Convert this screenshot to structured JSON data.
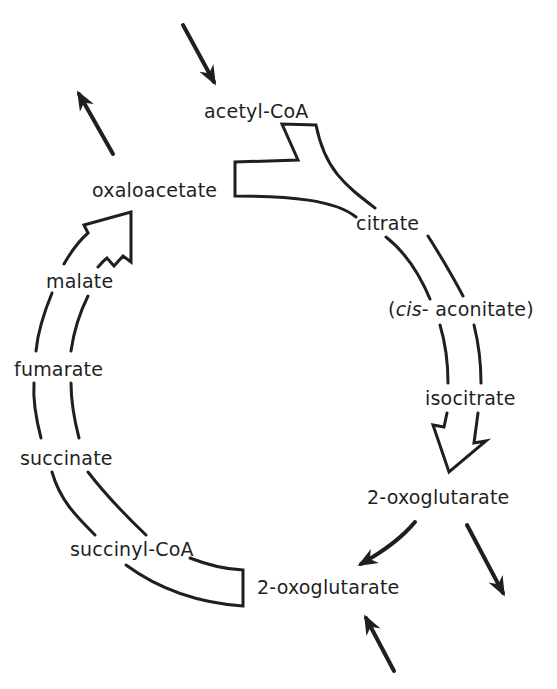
{
  "diagram": {
    "colors": {
      "ink": "#1f1f1f",
      "background": "#ffffff"
    },
    "metabolites": [
      {
        "id": "acetyl-coa",
        "label": "acetyl-CoA"
      },
      {
        "id": "oxaloacetate",
        "label": "oxaloacetate"
      },
      {
        "id": "citrate",
        "label": "citrate"
      },
      {
        "id": "cis-aconitate",
        "label_prefix": "(",
        "label_italic": "cis",
        "label_suffix": "- aconitate)"
      },
      {
        "id": "isocitrate",
        "label": "isocitrate"
      },
      {
        "id": "2-oxoglutarate-a",
        "label": "2-oxoglutarate"
      },
      {
        "id": "2-oxoglutarate-b",
        "label": "2-oxoglutarate"
      },
      {
        "id": "succinyl-coa",
        "label": "succinyl-CoA"
      },
      {
        "id": "succinate",
        "label": "succinate"
      },
      {
        "id": "fumarate",
        "label": "fumarate"
      },
      {
        "id": "malate",
        "label": "malate"
      }
    ],
    "flows": [
      {
        "from": "external",
        "to": "acetyl-CoA",
        "type": "input-arrow"
      },
      {
        "from": "oxaloacetate",
        "to": "external",
        "type": "output-arrow"
      },
      {
        "from": "acetyl-CoA + oxaloacetate",
        "to": "citrate",
        "type": "cycle-band"
      },
      {
        "from": "citrate",
        "to": "isocitrate",
        "type": "cycle-band"
      },
      {
        "from": "isocitrate",
        "to": "2-oxoglutarate",
        "type": "cycle-band-arrowhead"
      },
      {
        "from": "2-oxoglutarate",
        "to": "2-oxoglutarate",
        "type": "thin-arrow"
      },
      {
        "from": "2-oxoglutarate",
        "to": "external",
        "type": "output-arrow"
      },
      {
        "from": "external",
        "to": "2-oxoglutarate",
        "type": "input-arrow"
      },
      {
        "from": "2-oxoglutarate",
        "to": "succinyl-CoA",
        "type": "cycle-band"
      },
      {
        "from": "succinyl-CoA",
        "to": "oxaloacetate",
        "type": "cycle-band-arrowhead"
      }
    ]
  }
}
